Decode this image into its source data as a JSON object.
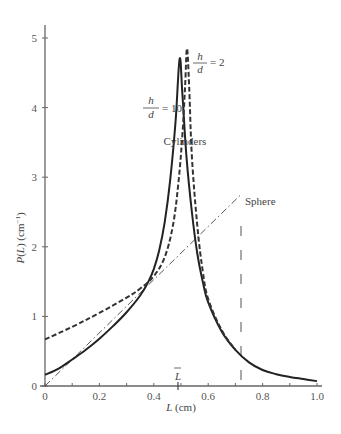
{
  "chart_data": {
    "type": "line",
    "title": "",
    "xlabel": "L (cm)",
    "ylabel": "P(L) (cm⁻¹)",
    "xlim": [
      0,
      1.0
    ],
    "ylim": [
      0,
      5.2
    ],
    "x_ticks": [
      "0",
      "0.2",
      "0.4",
      "0.6",
      "0.8",
      "1.0"
    ],
    "y_ticks": [
      "0",
      "1",
      "2",
      "3",
      "4",
      "5"
    ],
    "grid": false,
    "legend": "none (inline annotations)",
    "annotations": {
      "cylinders": "Cylinders",
      "sphere": "Sphere",
      "h_over_d_10_num": "h",
      "h_over_d_10_den": "d",
      "h_over_d_10_val": "= 10",
      "h_over_d_2_num": "h",
      "h_over_d_2_den": "d",
      "h_over_d_2_val": "= 2",
      "mean_marker": "L̄",
      "mean_marker_x": 0.49,
      "vertical_dashed_line_x": 0.72
    },
    "series": [
      {
        "name": "Cylinder h/d = 10",
        "style": "solid",
        "points": [
          [
            0.0,
            0.16
          ],
          [
            0.05,
            0.25
          ],
          [
            0.1,
            0.38
          ],
          [
            0.15,
            0.52
          ],
          [
            0.2,
            0.68
          ],
          [
            0.25,
            0.86
          ],
          [
            0.3,
            1.06
          ],
          [
            0.35,
            1.3
          ],
          [
            0.38,
            1.5
          ],
          [
            0.4,
            1.68
          ],
          [
            0.42,
            1.95
          ],
          [
            0.44,
            2.35
          ],
          [
            0.46,
            2.95
          ],
          [
            0.48,
            3.8
          ],
          [
            0.495,
            4.7
          ],
          [
            0.505,
            4.2
          ],
          [
            0.52,
            3.3
          ],
          [
            0.54,
            2.5
          ],
          [
            0.56,
            1.9
          ],
          [
            0.58,
            1.5
          ],
          [
            0.6,
            1.2
          ],
          [
            0.65,
            0.78
          ],
          [
            0.7,
            0.52
          ],
          [
            0.75,
            0.34
          ],
          [
            0.8,
            0.23
          ],
          [
            0.85,
            0.17
          ],
          [
            0.9,
            0.13
          ],
          [
            0.95,
            0.1
          ],
          [
            1.0,
            0.07
          ]
        ]
      },
      {
        "name": "Cylinder h/d = 2",
        "style": "dashed",
        "points": [
          [
            0.0,
            0.67
          ],
          [
            0.1,
            0.85
          ],
          [
            0.2,
            1.05
          ],
          [
            0.3,
            1.27
          ],
          [
            0.35,
            1.4
          ],
          [
            0.4,
            1.58
          ],
          [
            0.44,
            1.85
          ],
          [
            0.47,
            2.3
          ],
          [
            0.49,
            2.9
          ],
          [
            0.505,
            3.6
          ],
          [
            0.515,
            4.3
          ],
          [
            0.522,
            4.85
          ],
          [
            0.53,
            4.3
          ],
          [
            0.54,
            3.3
          ],
          [
            0.56,
            2.3
          ],
          [
            0.58,
            1.65
          ],
          [
            0.6,
            1.25
          ],
          [
            0.65,
            0.8
          ],
          [
            0.7,
            0.52
          ]
        ]
      },
      {
        "name": "Sphere",
        "style": "dashdot",
        "points": [
          [
            0.0,
            0.0
          ],
          [
            0.72,
            2.75
          ]
        ],
        "cutoff_x": 0.72
      }
    ]
  }
}
